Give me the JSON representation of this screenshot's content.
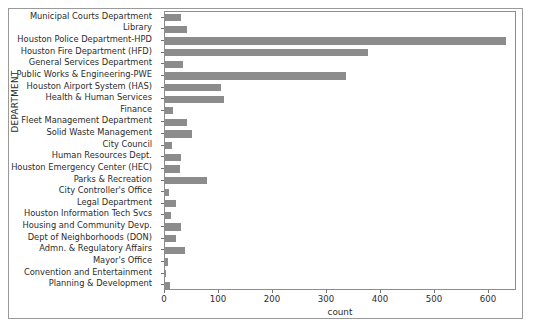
{
  "chart_data": {
    "type": "bar",
    "orientation": "horizontal",
    "title": "",
    "xlabel": "count",
    "ylabel": "DEPARTMENT",
    "xlim": [
      0,
      652
    ],
    "xticks": [
      0,
      100,
      200,
      300,
      400,
      500,
      600
    ],
    "xtick_labels": [
      "0",
      "100",
      "200",
      "300",
      "400",
      "500",
      "600"
    ],
    "grid": false,
    "legend": false,
    "bar_color": "#8c8c8c",
    "categories": [
      "Municipal Courts Department",
      "Library",
      "Houston Police Department-HPD",
      "Houston Fire Department (HFD)",
      "General Services Department",
      "Public Works & Engineering-PWE",
      "Houston Airport System (HAS)",
      "Health & Human Services",
      "Finance",
      "Fleet Management Department",
      "Solid Waste Management",
      "City Council",
      "Human Resources Dept.",
      "Houston Emergency Center (HEC)",
      "Parks & Recreation",
      "City Controller's Office",
      "Legal Department",
      "Houston Information Tech Svcs",
      "Housing and Community Devp.",
      "Dept of Neighborhoods (DON)",
      "Admn. & Regulatory Affairs",
      "Mayor's Office",
      "Convention and Entertainment",
      "Planning & Development"
    ],
    "values": [
      30,
      41,
      631,
      376,
      33,
      335,
      104,
      109,
      15,
      41,
      50,
      13,
      30,
      28,
      78,
      7,
      20,
      11,
      30,
      20,
      37,
      5,
      2,
      9
    ]
  }
}
